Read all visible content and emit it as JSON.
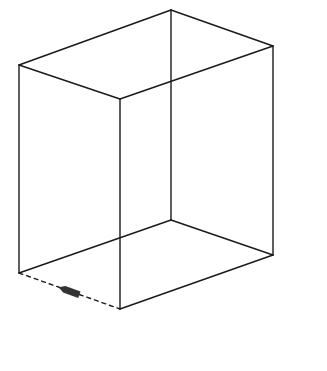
{
  "diagram": {
    "type": "wireframe-box",
    "stroke_color": "#1a1a1a",
    "background_color": "#ffffff",
    "arrow_color": "#333333",
    "vertices": {
      "top_left": [
        19,
        65
      ],
      "top_back": [
        171,
        10
      ],
      "top_right": [
        273,
        46
      ],
      "top_front": [
        120,
        99
      ],
      "bottom_left": [
        19,
        273
      ],
      "bottom_back": [
        171,
        220
      ],
      "bottom_right": [
        273,
        255
      ],
      "bottom_front": [
        120,
        309
      ]
    },
    "edges": {
      "solid": [
        [
          "top_left",
          "top_back"
        ],
        [
          "top_back",
          "top_right"
        ],
        [
          "top_right",
          "top_front"
        ],
        [
          "top_front",
          "top_left"
        ],
        [
          "top_left",
          "bottom_left"
        ],
        [
          "top_front",
          "bottom_front"
        ],
        [
          "top_right",
          "bottom_right"
        ],
        [
          "top_back",
          "bottom_back"
        ],
        [
          "bottom_left",
          "bottom_back"
        ],
        [
          "bottom_back",
          "bottom_right"
        ],
        [
          "bottom_right",
          "bottom_front"
        ]
      ],
      "dashed": [
        [
          "bottom_left",
          "bottom_front"
        ]
      ]
    },
    "arrow": {
      "on_edge": [
        "bottom_left",
        "bottom_front"
      ],
      "direction": "toward bottom_left",
      "center": [
        69,
        291
      ]
    }
  }
}
